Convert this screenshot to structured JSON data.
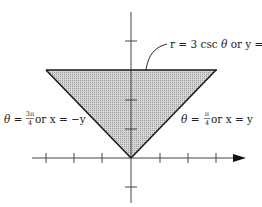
{
  "diagram": {
    "type": "polar-region",
    "labels": {
      "top_line": "r = 3 csc θ or y = 3",
      "top_line_parts": {
        "lhs": "r = 3 csc ",
        "theta": "θ",
        "rhs": " or y = 3"
      },
      "left_line": {
        "theta": "θ",
        "eq": " = ",
        "frac_num": "3π",
        "frac_den": "4",
        "rest": " or x = −y"
      },
      "right_line": {
        "theta": "θ",
        "eq": " = ",
        "frac_num": "π",
        "frac_den": "4",
        "rest": " or x = y"
      }
    },
    "axes": {
      "x_ticks": [
        -3,
        -2,
        -1,
        1,
        2,
        3
      ],
      "y_ticks": [
        -1,
        1,
        2,
        3,
        4
      ]
    },
    "region": {
      "vertices": [
        [
          -3,
          3
        ],
        [
          3,
          3
        ],
        [
          0,
          0
        ]
      ],
      "fill": "#c8c8c8",
      "stroke": "#222222"
    }
  }
}
